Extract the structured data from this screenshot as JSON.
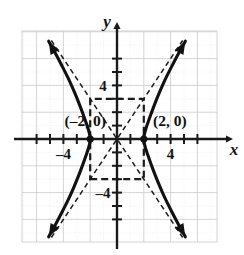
{
  "figure": {
    "axis_labels": {
      "x": "x",
      "y": "y"
    },
    "tick_labels": {
      "x_positive": "4",
      "x_negative": "–4",
      "y_positive": "4",
      "y_negative": "–4"
    },
    "point_labels": {
      "left_vertex": "(–2, 0)",
      "right_vertex": "(2, 0)"
    },
    "colors": {
      "curve": "#111111",
      "axis": "#1a1a1a",
      "grid_major": "#c9c9c9",
      "grid_minor": "#e2e2e2",
      "dashed": "#1a1a1a",
      "background": "#ffffff"
    }
  },
  "chart_data": {
    "type": "line",
    "title": "",
    "xlabel": "x",
    "ylabel": "y",
    "xlim": [
      -7,
      7.5
    ],
    "ylim": [
      -7.8,
      7.8
    ],
    "grid": true,
    "grid_spacing": 2,
    "tick_spacing": 1,
    "legend": "none",
    "equation": "x^2/4 - y^2/9 = 1",
    "curve_type": "hyperbola",
    "center": [
      0,
      0
    ],
    "a": 2,
    "b": 3,
    "vertices": [
      [
        -2,
        0
      ],
      [
        2,
        0
      ]
    ],
    "annotations": [
      {
        "text": "(–2, 0)",
        "x": -2,
        "y": 0,
        "placement": "above-left"
      },
      {
        "text": "(2, 0)",
        "x": 2,
        "y": 0,
        "placement": "above-right"
      }
    ],
    "xticks": [
      -6,
      -5,
      -4,
      -3,
      -2,
      -1,
      1,
      2,
      3,
      4,
      5,
      6
    ],
    "yticks": [
      -6,
      -5,
      -4,
      -3,
      -2,
      -1,
      1,
      2,
      3,
      4,
      5,
      6
    ],
    "xtick_labels_shown": [
      {
        "value": -4,
        "label": "–4"
      },
      {
        "value": 4,
        "label": "4"
      }
    ],
    "ytick_labels_shown": [
      {
        "value": 4,
        "label": "4"
      },
      {
        "value": -4,
        "label": "–4"
      }
    ],
    "series": [
      {
        "name": "right-branch",
        "style": "solid",
        "arrows": "both",
        "points": [
          [
            5.1,
            -7.3
          ],
          [
            4.6,
            -6.4
          ],
          [
            4.1,
            -5.45
          ],
          [
            3.6,
            -4.45
          ],
          [
            3.2,
            -3.55
          ],
          [
            2.85,
            -2.7
          ],
          [
            2.55,
            -1.9
          ],
          [
            2.3,
            -1.2
          ],
          [
            2.12,
            -0.65
          ],
          [
            2.02,
            -0.22
          ],
          [
            2.0,
            0.0
          ],
          [
            2.02,
            0.22
          ],
          [
            2.12,
            0.65
          ],
          [
            2.3,
            1.2
          ],
          [
            2.55,
            1.9
          ],
          [
            2.85,
            2.7
          ],
          [
            3.2,
            3.55
          ],
          [
            3.6,
            4.45
          ],
          [
            4.1,
            5.45
          ],
          [
            4.6,
            6.4
          ],
          [
            5.1,
            7.3
          ]
        ]
      },
      {
        "name": "left-branch",
        "style": "solid",
        "arrows": "both",
        "points": [
          [
            -5.1,
            -7.3
          ],
          [
            -4.6,
            -6.4
          ],
          [
            -4.1,
            -5.45
          ],
          [
            -3.6,
            -4.45
          ],
          [
            -3.2,
            -3.55
          ],
          [
            -2.85,
            -2.7
          ],
          [
            -2.55,
            -1.9
          ],
          [
            -2.3,
            -1.2
          ],
          [
            -2.12,
            -0.65
          ],
          [
            -2.02,
            -0.22
          ],
          [
            -2.0,
            0.0
          ],
          [
            -2.02,
            0.22
          ],
          [
            -2.12,
            0.65
          ],
          [
            -2.3,
            1.2
          ],
          [
            -2.55,
            1.9
          ],
          [
            -2.85,
            2.7
          ],
          [
            -3.2,
            3.55
          ],
          [
            -3.6,
            4.45
          ],
          [
            -4.1,
            5.45
          ],
          [
            -4.6,
            6.4
          ],
          [
            -5.1,
            7.3
          ]
        ]
      },
      {
        "name": "asymptote-positive-slope",
        "style": "dashed",
        "slope": 1.5,
        "points": [
          [
            -4.9,
            -7.35
          ],
          [
            4.9,
            7.35
          ]
        ]
      },
      {
        "name": "asymptote-negative-slope",
        "style": "dashed",
        "slope": -1.5,
        "points": [
          [
            -4.9,
            7.35
          ],
          [
            4.9,
            -7.35
          ]
        ]
      },
      {
        "name": "reference-rectangle",
        "style": "dashed",
        "corners": [
          [
            -2,
            -3
          ],
          [
            2,
            -3
          ],
          [
            2,
            3
          ],
          [
            -2,
            3
          ]
        ]
      }
    ]
  }
}
